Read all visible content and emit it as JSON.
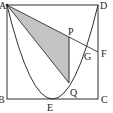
{
  "diagram": {
    "type": "geometry",
    "labels": {
      "A": "A",
      "B": "B",
      "C": "C",
      "D": "D",
      "E": "E",
      "F": "F",
      "G": "G",
      "P": "P",
      "Q": "Q"
    },
    "colors": {
      "line": "#1a1a1a",
      "shade": "#c4c4c4",
      "background": "#ffffff"
    }
  }
}
